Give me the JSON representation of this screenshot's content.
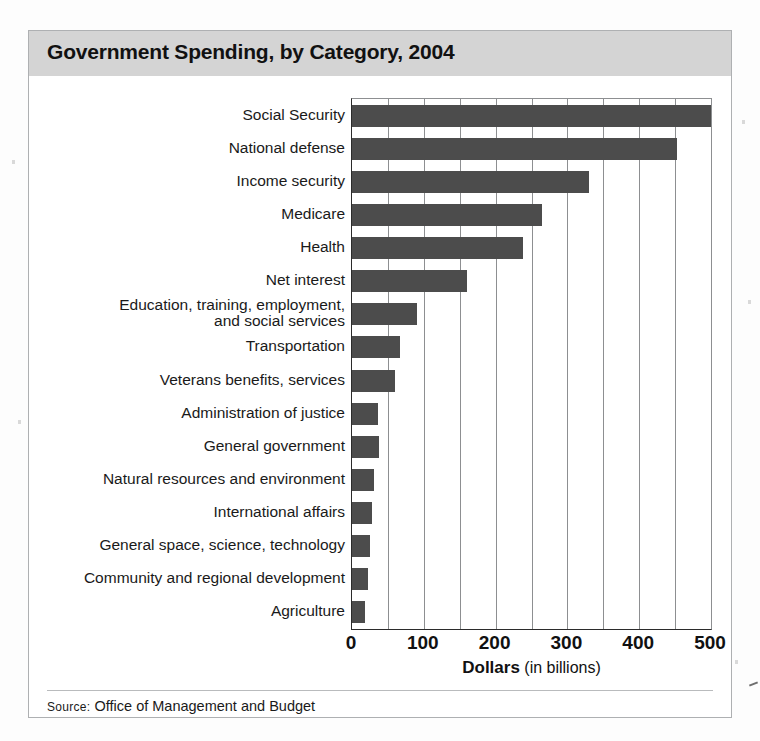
{
  "figure": {
    "title": "Government Spending, by Category, 2004",
    "source_prefix": "Source:",
    "source_text": "Office of Management and Budget"
  },
  "chart_data": {
    "type": "bar",
    "orientation": "horizontal",
    "title": "Government Spending, by Category, 2004",
    "xlabel_bold": "Dollars",
    "xlabel_rest": "(in billions)",
    "ylabel": "",
    "xlim": [
      0,
      500
    ],
    "xticks": [
      0,
      100,
      200,
      300,
      400,
      500
    ],
    "xtick_labels": [
      "0",
      "100",
      "200",
      "300",
      "400",
      "500"
    ],
    "minor_gridlines_every": 50,
    "grid": true,
    "legend": "none",
    "bar_color": "#4c4c4c",
    "categories": [
      "Social Security",
      "National defense",
      "Income security",
      "Medicare",
      "Health",
      "Net interest",
      "Education, training, employment,\nand social services",
      "Transportation",
      "Veterans benefits, services",
      "Administration of justice",
      "General government",
      "Natural resources and environment",
      "International affairs",
      "General space, science, technology",
      "Community and regional development",
      "Agriculture"
    ],
    "values": [
      500,
      453,
      330,
      265,
      238,
      160,
      90,
      67,
      60,
      36,
      38,
      30,
      28,
      25,
      22,
      18
    ],
    "units": "billions of dollars"
  }
}
